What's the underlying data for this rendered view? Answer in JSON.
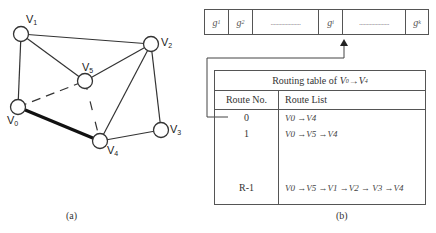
{
  "figure_a": {
    "caption": "(a)",
    "nodes": [
      {
        "id": "V0",
        "label": "V",
        "sub": "0",
        "cx": 18,
        "cy": 107
      },
      {
        "id": "V1",
        "label": "V",
        "sub": "1",
        "cx": 21,
        "cy": 34
      },
      {
        "id": "V2",
        "label": "V",
        "sub": "2",
        "cx": 151,
        "cy": 44
      },
      {
        "id": "V3",
        "label": "V",
        "sub": "3",
        "cx": 161,
        "cy": 130
      },
      {
        "id": "V4",
        "label": "V",
        "sub": "4",
        "cx": 100,
        "cy": 141
      },
      {
        "id": "V5",
        "label": "V",
        "sub": "5",
        "cx": 85,
        "cy": 81
      }
    ],
    "edges": [
      {
        "from": "V0",
        "to": "V1",
        "style": "solid"
      },
      {
        "from": "V1",
        "to": "V2",
        "style": "solid"
      },
      {
        "from": "V1",
        "to": "V5",
        "style": "solid"
      },
      {
        "from": "V5",
        "to": "V2",
        "style": "solid"
      },
      {
        "from": "V2",
        "to": "V4",
        "style": "solid"
      },
      {
        "from": "V2",
        "to": "V3",
        "style": "solid"
      },
      {
        "from": "V3",
        "to": "V4",
        "style": "solid"
      },
      {
        "from": "V0",
        "to": "V4",
        "style": "bold"
      },
      {
        "from": "V0",
        "to": "V5",
        "style": "dashed"
      },
      {
        "from": "V5",
        "to": "V4",
        "style": "dashed"
      }
    ]
  },
  "figure_b": {
    "caption": "(b)",
    "gene_bar": [
      {
        "label": "g",
        "sub": "1"
      },
      {
        "label": "g",
        "sub": "2"
      },
      {
        "label": "...................."
      },
      {
        "label": "g",
        "sub": "i"
      },
      {
        "label": "...................."
      },
      {
        "label": "g",
        "sub": "k"
      }
    ],
    "table": {
      "title": "Routing table of V0 → V4",
      "title_prefix": "Routing table of ",
      "title_from": "V",
      "title_from_sub": "0",
      "title_arrow": " →",
      "title_to": "V",
      "title_to_sub": "4",
      "headers": [
        "Route No.",
        "Route List"
      ],
      "rows": [
        {
          "no": "0",
          "route": "V0 →V4"
        },
        {
          "no": "1",
          "route": "V0 →V5 →V4"
        },
        {
          "no": "R-1",
          "route": "V0 →V5 →V1 →V2 → V3 →V4"
        }
      ]
    }
  }
}
